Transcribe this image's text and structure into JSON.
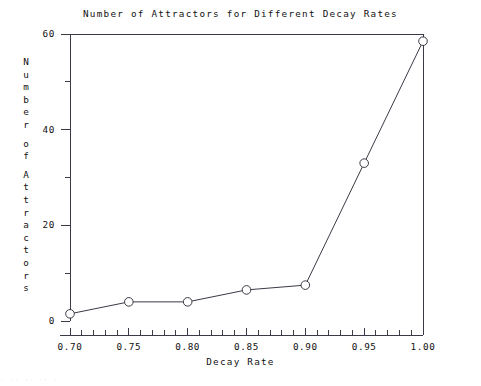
{
  "chart_data": {
    "type": "line",
    "title": "Number of Attractors for Different Decay Rates",
    "xlabel": "Decay Rate",
    "ylabel": "Number of Attractors",
    "ylabel_chars": [
      "N",
      "u",
      "m",
      "b",
      "e",
      "r",
      "",
      "o",
      "f",
      "",
      "A",
      "t",
      "t",
      "r",
      "a",
      "c",
      "t",
      "o",
      "r",
      "s"
    ],
    "x": [
      0.7,
      0.75,
      0.8,
      0.85,
      0.9,
      0.95,
      1.0
    ],
    "values": [
      1.5,
      4,
      4,
      6.5,
      7.5,
      33,
      58.5
    ],
    "series": [
      {
        "name": "Attractors",
        "values": [
          1.5,
          4,
          4,
          6.5,
          7.5,
          33,
          58.5
        ]
      }
    ],
    "xlim": [
      0.7,
      1.0
    ],
    "ylim": [
      0,
      60
    ],
    "xticks": [
      0.7,
      0.75,
      0.8,
      0.85,
      0.9,
      0.95,
      1.0
    ],
    "xtick_labels": [
      "0.70",
      "0.75",
      "0.80",
      "0.85",
      "0.90",
      "0.95",
      "1.00"
    ],
    "x_minor_step": 0.01,
    "yticks": [
      0,
      20,
      40,
      60
    ],
    "ytick_labels": [
      "0",
      "20",
      "40",
      "60"
    ],
    "y_minor_ticks": [
      10,
      30,
      50
    ],
    "grid": false,
    "legend": null,
    "marker": "open-circle",
    "line_color": "#3a3a46",
    "marker_edge_color": "#3a3a46",
    "marker_face_color": "#ffffff",
    "axis_color": "#3a3a46",
    "background": "#ffffff"
  },
  "axes": {
    "top_spine": true,
    "left_spine": true,
    "right_edge_line": true,
    "bottom_axis": true
  },
  "caption_artifact": "· ·· ·· ·· ·"
}
